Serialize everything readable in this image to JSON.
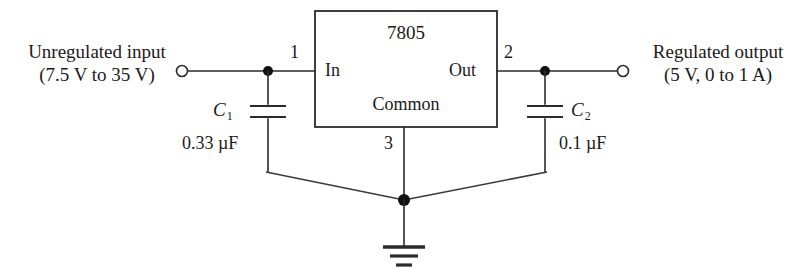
{
  "diagram": {
    "title_text": "7805 voltage regulator circuit",
    "ic": {
      "part_number": "7805",
      "pin_in_label": "In",
      "pin_out_label": "Out",
      "pin_common_label": "Common",
      "pin_numbers": {
        "input": "1",
        "output": "2",
        "common": "3"
      }
    },
    "input_port": {
      "line1": "Unregulated input",
      "line2": "(7.5 V to 35 V)",
      "terminal_icon": "open-terminal-circle-icon"
    },
    "output_port": {
      "line1": "Regulated output",
      "line2": "(5 V, 0 to 1 A)",
      "terminal_icon": "open-terminal-circle-icon"
    },
    "capacitors": [
      {
        "name": "C",
        "subscript": "1",
        "value": "0.33 µF",
        "icon": "capacitor-icon"
      },
      {
        "name": "C",
        "subscript": "2",
        "value": "0.1 µF",
        "icon": "capacitor-icon"
      }
    ],
    "ground": {
      "icon": "ground-icon"
    },
    "colors": {
      "background": "#ffffff",
      "line": "#2b2b2b",
      "text": "#1a1a1a",
      "node": "#111111"
    }
  }
}
